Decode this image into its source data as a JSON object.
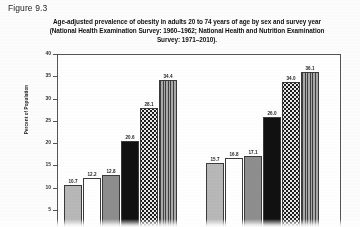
{
  "figure": {
    "label": "Figure 9.3",
    "title_line_1": "Age-adjusted prevalence of obesity in adults 20 to 74 years of age by sex and survey year",
    "title_line_2": "(National Health Examination Survey: 1960–1962; National Health and Nutrition Examination",
    "title_line_3": "Survey: 1971–2010)."
  },
  "chart_data": {
    "type": "bar",
    "xlabel": "",
    "ylabel": "Percent of Population",
    "ylim": [
      0,
      40
    ],
    "yticks": [
      5,
      10,
      15,
      20,
      25,
      30,
      35,
      40
    ],
    "ytick_labels": [
      "5",
      "10",
      "15",
      "20",
      "25",
      "30",
      "35",
      "40"
    ],
    "grid": false,
    "legend": "below-axis (cropped)",
    "categories": [
      "Men",
      "Women"
    ],
    "series": [
      {
        "name": "1960–1962",
        "fill": "light-gray",
        "values": [
          10.7,
          15.7
        ]
      },
      {
        "name": "1971–1974",
        "fill": "white",
        "values": [
          12.2,
          16.8
        ]
      },
      {
        "name": "1976–1980",
        "fill": "medium-gray",
        "values": [
          12.8,
          17.1
        ]
      },
      {
        "name": "1988–1994",
        "fill": "black",
        "values": [
          20.6,
          26.0
        ]
      },
      {
        "name": "1999–2002",
        "fill": "dotted",
        "values": [
          28.1,
          34.0
        ]
      },
      {
        "name": "2009–2010",
        "fill": "vertical-stripe",
        "values": [
          34.4,
          36.1
        ]
      }
    ],
    "bar_value_labels": {
      "men": [
        "10.7",
        "12.2",
        "12.8",
        "20.6",
        "28.1",
        "34.4"
      ],
      "women": [
        "15.7",
        "16.8",
        "17.1",
        "26.0",
        "34.0",
        "36.1"
      ]
    }
  }
}
